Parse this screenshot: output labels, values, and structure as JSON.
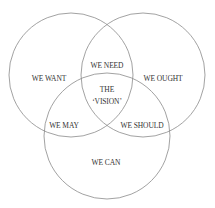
{
  "diagram": {
    "type": "venn",
    "stroke_color": "#888888",
    "circles": [
      {
        "id": "top-left",
        "label": "WE WANT",
        "cx": 71,
        "cy": 75,
        "r": 62
      },
      {
        "id": "top-right",
        "label": "WE OUGHT",
        "cx": 143,
        "cy": 75,
        "r": 62
      },
      {
        "id": "bottom",
        "label": "WE CAN",
        "cx": 107,
        "cy": 136,
        "r": 63
      }
    ],
    "labels": {
      "we_want": "WE WANT",
      "we_ought": "WE OUGHT",
      "we_can": "WE CAN",
      "we_need": "WE NEED",
      "we_may": "WE MAY",
      "we_should": "WE SHOULD",
      "center_line1": "THE",
      "center_line2": "‘VISION’"
    }
  }
}
